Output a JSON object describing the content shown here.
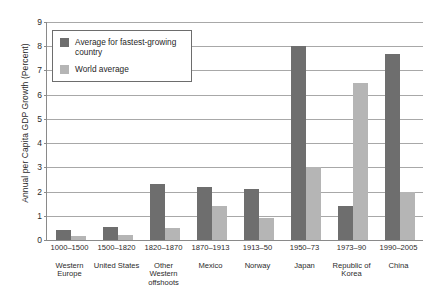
{
  "chart_data": {
    "type": "bar",
    "title": "",
    "xlabel": "",
    "ylabel": "Annual per Capita GDP Growth (Percent)",
    "ylim": [
      0,
      9
    ],
    "yticks": [
      0,
      1,
      2,
      3,
      4,
      5,
      6,
      7,
      8,
      9
    ],
    "grid": true,
    "legend_position": "upper-left-inside",
    "categories": [
      "Western Europe",
      "United States",
      "Other Western offshoots",
      "Mexico",
      "Norway",
      "Japan",
      "Republic of Korea",
      "China"
    ],
    "periods": [
      "1000–1500",
      "1500–1820",
      "1820–1870",
      "1870–1913",
      "1913–50",
      "1950–73",
      "1973–90",
      "1990–2005"
    ],
    "series": [
      {
        "name": "Average for fastest-growing country",
        "color": "#6e6e6e",
        "values": [
          0.4,
          0.55,
          2.3,
          2.2,
          2.1,
          8.0,
          1.4,
          7.7
        ]
      },
      {
        "name": "World average",
        "color": "#b5b5b5",
        "values": [
          0.15,
          0.2,
          0.5,
          1.4,
          0.9,
          3.0,
          6.5,
          2.0
        ]
      }
    ]
  },
  "legend": {
    "items": [
      {
        "label": "Average for fastest-growing country"
      },
      {
        "label": "World average"
      }
    ]
  },
  "colors": {
    "dark_bar": "#6e6e6e",
    "light_bar": "#b5b5b5",
    "axis": "#8a8a8a",
    "gridline": "#a8a8a8",
    "text": "#2b2b2b"
  }
}
